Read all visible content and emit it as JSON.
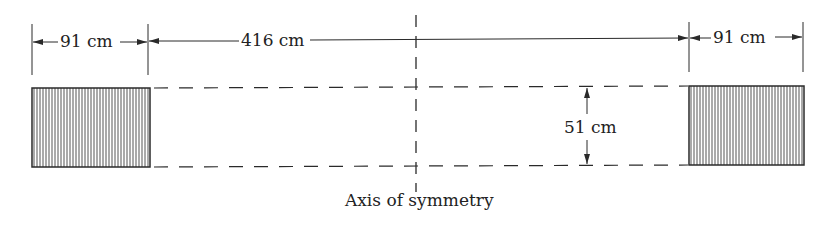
{
  "diagram": {
    "type": "dimensioned cross-section",
    "left_width_label": "91 cm",
    "span_label": "416 cm",
    "right_width_label": "91 cm",
    "height_label": "51 cm",
    "axis_label": "Axis of symmetry",
    "colors": {
      "line": "#2a2a2a",
      "hatch": "#555555",
      "background": "#ffffff"
    },
    "elements": {
      "left_block": {
        "x": 32,
        "y": 88,
        "w": 118,
        "h": 79,
        "fill": "vertical-hatch"
      },
      "right_block": {
        "x": 689,
        "y": 86,
        "w": 115,
        "h": 79,
        "fill": "vertical-hatch"
      },
      "axis_x": 416
    }
  }
}
